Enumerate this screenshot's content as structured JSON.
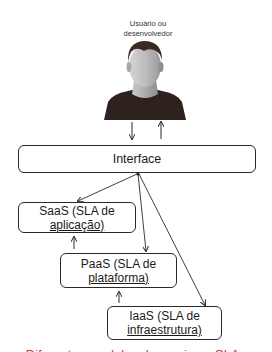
{
  "user": {
    "label_line1": "Usuário ou",
    "label_line2": "desenvolvedor",
    "icon": "user-avatar-icon"
  },
  "interface": {
    "label": "Interface"
  },
  "services": [
    {
      "name": "saas",
      "line1": "SaaS (SLA de",
      "line2": "aplicação)"
    },
    {
      "name": "paas",
      "line1": "PaaS (SLA de",
      "line2": "plataforma)"
    },
    {
      "name": "iaas",
      "line1": "IaaS (SLA de",
      "line2": "infraestrutura)"
    }
  ],
  "caption": {
    "text": "Diferentes modelos de serviço e SLAs",
    "color": "#d9342b"
  },
  "colors": {
    "line": "#2a2a2a",
    "hair": "#3b2a24",
    "face": "#b5b5b5",
    "shirt": "#2e221e"
  }
}
